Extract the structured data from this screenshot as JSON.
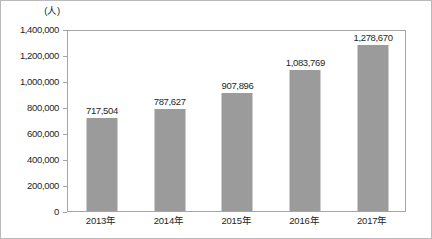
{
  "chart_data": {
    "type": "bar",
    "title": "",
    "subtitle": "",
    "unit_label": "(人)",
    "xlabel": "",
    "ylabel": "",
    "categories": [
      "2013年",
      "2014年",
      "2015年",
      "2016年",
      "2017年"
    ],
    "values": [
      717504,
      1083769,
      907896,
      1278670,
      787627
    ],
    "series": [
      {
        "name": "人数",
        "values": [
          717504,
          787627,
          907896,
          1083769,
          1278670
        ],
        "value_labels": [
          "717,504",
          "787,627",
          "907,896",
          "1,083,769",
          "1,278,670"
        ]
      }
    ],
    "ylim": [
      0,
      1400000
    ],
    "ytick_values": [
      0,
      200000,
      400000,
      600000,
      800000,
      1000000,
      1200000,
      1400000
    ],
    "ytick_labels": [
      "1,400,000",
      "1,200,000",
      "1,000,000",
      "800,000",
      "600,000",
      "400,000",
      "200,000",
      "0"
    ],
    "grid": false,
    "legend": false,
    "bar_color": "#9b9b9b",
    "frame_color": "#a5a5a5",
    "text_color": "#231f1f",
    "background": "#ffffff"
  }
}
